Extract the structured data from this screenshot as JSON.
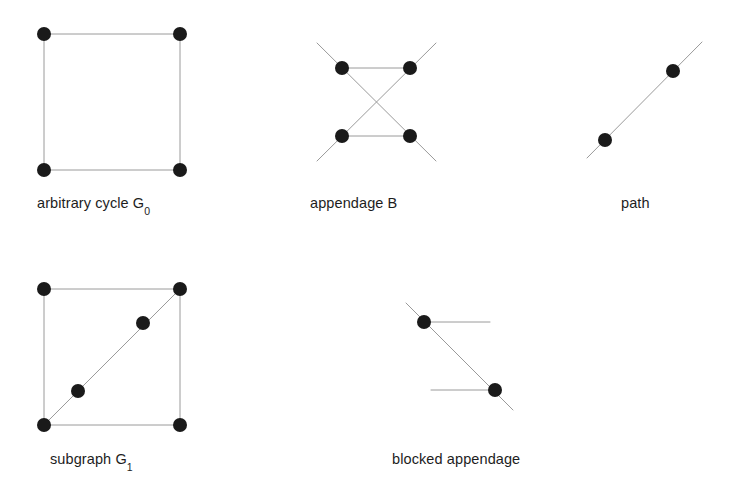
{
  "figure": {
    "background_color": "#ffffff",
    "edge_color": "#9a9a9a",
    "node_color": "#1a1a1a",
    "edge_width": 1,
    "node_radius": 7,
    "panels": [
      {
        "id": "arbitrary-cycle",
        "caption": "arbitrary cycle  G",
        "caption_subscript": "0",
        "nodes": [
          {
            "id": "c-tl",
            "x": 44,
            "y": 34
          },
          {
            "id": "c-tr",
            "x": 180,
            "y": 34
          },
          {
            "id": "c-bl",
            "x": 44,
            "y": 170
          },
          {
            "id": "c-br",
            "x": 180,
            "y": 170
          }
        ],
        "edges": [
          {
            "x1": 44,
            "y1": 34,
            "x2": 180,
            "y2": 34
          },
          {
            "x1": 180,
            "y1": 34,
            "x2": 180,
            "y2": 170
          },
          {
            "x1": 180,
            "y1": 170,
            "x2": 44,
            "y2": 170
          },
          {
            "x1": 44,
            "y1": 170,
            "x2": 44,
            "y2": 34
          }
        ]
      },
      {
        "id": "appendage",
        "caption": "appendage  B",
        "caption_subscript": "",
        "nodes": [
          {
            "id": "a-tl",
            "x": 342,
            "y": 68
          },
          {
            "id": "a-tr",
            "x": 410,
            "y": 68
          },
          {
            "id": "a-bl",
            "x": 342,
            "y": 136
          },
          {
            "id": "a-br",
            "x": 410,
            "y": 136
          }
        ],
        "edges": [
          {
            "x1": 342,
            "y1": 68,
            "x2": 410,
            "y2": 68
          },
          {
            "x1": 342,
            "y1": 136,
            "x2": 410,
            "y2": 136
          },
          {
            "x1": 317,
            "y1": 43,
            "x2": 436,
            "y2": 161
          },
          {
            "x1": 436,
            "y1": 43,
            "x2": 317,
            "y2": 161
          }
        ]
      },
      {
        "id": "path",
        "caption": "path",
        "caption_subscript": "",
        "nodes": [
          {
            "id": "p-1",
            "x": 605,
            "y": 140
          },
          {
            "id": "p-2",
            "x": 673,
            "y": 71
          }
        ],
        "edges": [
          {
            "x1": 587,
            "y1": 158,
            "x2": 702,
            "y2": 42
          }
        ]
      },
      {
        "id": "subgraph",
        "caption": "subgraph G",
        "caption_subscript": "1",
        "nodes": [
          {
            "id": "s-tl",
            "x": 44,
            "y": 289
          },
          {
            "id": "s-tr",
            "x": 180,
            "y": 289
          },
          {
            "id": "s-bl",
            "x": 44,
            "y": 425
          },
          {
            "id": "s-br",
            "x": 180,
            "y": 425
          },
          {
            "id": "s-d1",
            "x": 78,
            "y": 391
          },
          {
            "id": "s-d2",
            "x": 143,
            "y": 323
          }
        ],
        "edges": [
          {
            "x1": 44,
            "y1": 289,
            "x2": 180,
            "y2": 289
          },
          {
            "x1": 180,
            "y1": 289,
            "x2": 180,
            "y2": 425
          },
          {
            "x1": 180,
            "y1": 425,
            "x2": 44,
            "y2": 425
          },
          {
            "x1": 44,
            "y1": 425,
            "x2": 44,
            "y2": 289
          },
          {
            "x1": 44,
            "y1": 425,
            "x2": 180,
            "y2": 289
          }
        ]
      },
      {
        "id": "blocked-appendage",
        "caption": "blocked appendage",
        "caption_subscript": "",
        "nodes": [
          {
            "id": "b-1",
            "x": 424,
            "y": 322
          },
          {
            "id": "b-2",
            "x": 495,
            "y": 390
          }
        ],
        "edges": [
          {
            "x1": 406,
            "y1": 303,
            "x2": 513,
            "y2": 410
          },
          {
            "x1": 424,
            "y1": 322,
            "x2": 490,
            "y2": 322
          },
          {
            "x1": 431,
            "y1": 390,
            "x2": 495,
            "y2": 390
          }
        ]
      }
    ]
  }
}
